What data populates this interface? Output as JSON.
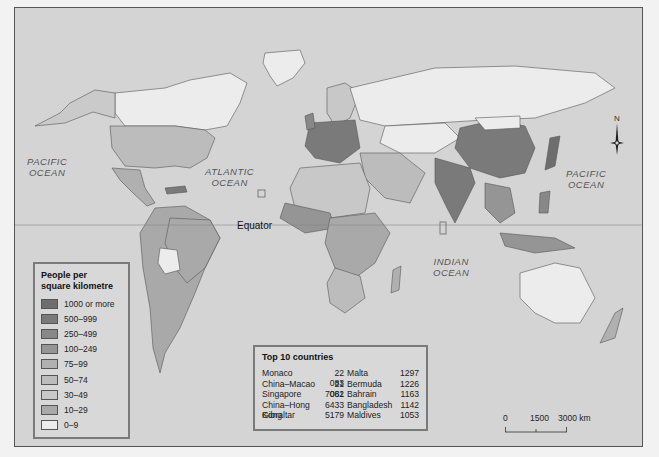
{
  "map": {
    "title": "People per square kilometre",
    "ocean_labels": [
      {
        "id": "pacific-west",
        "line1": "PACIFIC",
        "line2": "OCEAN"
      },
      {
        "id": "atlantic",
        "line1": "ATLANTIC",
        "line2": "OCEAN"
      },
      {
        "id": "indian",
        "line1": "INDIAN",
        "line2": "OCEAN"
      },
      {
        "id": "pacific-east",
        "line1": "PACIFIC",
        "line2": "OCEAN"
      }
    ],
    "equator_label": "Equator",
    "compass_label": "N"
  },
  "legend": {
    "title_line1": "People per",
    "title_line2": "square kilometre",
    "items": [
      {
        "label": "1000 or more",
        "color": "#6e6e6e"
      },
      {
        "label": "500–999",
        "color": "#7a7a7a"
      },
      {
        "label": "250–499",
        "color": "#888888"
      },
      {
        "label": "100–249",
        "color": "#959595"
      },
      {
        "label": "75–99",
        "color": "#b0b0b0"
      },
      {
        "label": "50–74",
        "color": "#bcbcbc"
      },
      {
        "label": "30–49",
        "color": "#c8c8c8"
      },
      {
        "label": "10–29",
        "color": "#a9a9a9"
      },
      {
        "label": "0–9",
        "color": "#ececec"
      }
    ]
  },
  "top10": {
    "title": "Top 10 countries",
    "col1": [
      {
        "name": "Monaco",
        "value": "22 083"
      },
      {
        "name": "China–Macao",
        "value": "21 061"
      },
      {
        "name": "Singapore",
        "value": "7082"
      },
      {
        "name": "China–Hong Kong",
        "value": "6433"
      },
      {
        "name": "Gibraltar",
        "value": "5179"
      }
    ],
    "col2": [
      {
        "name": "Malta",
        "value": "1297"
      },
      {
        "name": "Bermuda",
        "value": "1226"
      },
      {
        "name": "Bahrain",
        "value": "1163"
      },
      {
        "name": "Bangladesh",
        "value": "1142"
      },
      {
        "name": "Maldives",
        "value": "1053"
      }
    ]
  },
  "scale_bar": {
    "ticks": [
      "0",
      "1500",
      "3000 km"
    ]
  },
  "colors": {
    "ocean": "#d4d4d4",
    "border": "#555555"
  }
}
